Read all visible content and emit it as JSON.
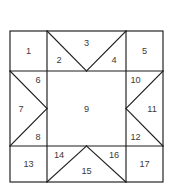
{
  "diagram": {
    "type": "geometric-partition",
    "shape": "3x3 grid with triangular subdivisions",
    "background_color": "#ffffff",
    "line_color": "#1d1d1d",
    "label_color": "#3a3a3a",
    "geometry": {
      "left": 10,
      "top": 31,
      "right": 163,
      "bottom": 182,
      "v_divider_1": 47,
      "v_divider_2": 126,
      "h_divider_1": 71,
      "h_divider_2": 146
    },
    "regions": [
      {
        "id": "region-1",
        "label": "1",
        "cell": "top-left",
        "shape": "square",
        "lx": 28.5,
        "ly": 51
      },
      {
        "id": "region-2",
        "label": "2",
        "cell": "top-middle",
        "shape": "triangle",
        "lx": 59,
        "ly": 60
      },
      {
        "id": "region-3",
        "label": "3",
        "cell": "top-middle",
        "shape": "triangle",
        "lx": 86.5,
        "ly": 43
      },
      {
        "id": "region-4",
        "label": "4",
        "cell": "top-middle",
        "shape": "triangle",
        "lx": 114,
        "ly": 60
      },
      {
        "id": "region-5",
        "label": "5",
        "cell": "top-right",
        "shape": "square",
        "lx": 144.5,
        "ly": 51
      },
      {
        "id": "region-6",
        "label": "6",
        "cell": "middle-left",
        "shape": "triangle",
        "lx": 38,
        "ly": 80
      },
      {
        "id": "region-7",
        "label": "7",
        "cell": "middle-left",
        "shape": "triangle",
        "lx": 21,
        "ly": 108.5
      },
      {
        "id": "region-8",
        "label": "8",
        "cell": "middle-left",
        "shape": "triangle",
        "lx": 38,
        "ly": 137
      },
      {
        "id": "region-9",
        "label": "9",
        "cell": "center",
        "shape": "square",
        "lx": 86.5,
        "ly": 108.5
      },
      {
        "id": "region-10",
        "label": "10",
        "cell": "middle-right",
        "shape": "triangle",
        "lx": 135.5,
        "ly": 80
      },
      {
        "id": "region-11",
        "label": "11",
        "cell": "middle-right",
        "shape": "triangle",
        "lx": 152,
        "ly": 108.5
      },
      {
        "id": "region-12",
        "label": "12",
        "cell": "middle-right",
        "shape": "triangle",
        "lx": 135.5,
        "ly": 137
      },
      {
        "id": "region-13",
        "label": "13",
        "cell": "bottom-left",
        "shape": "square",
        "lx": 28.5,
        "ly": 164
      },
      {
        "id": "region-14",
        "label": "14",
        "cell": "bottom-middle",
        "shape": "triangle",
        "lx": 59,
        "ly": 155
      },
      {
        "id": "region-15",
        "label": "15",
        "cell": "bottom-middle",
        "shape": "triangle",
        "lx": 86.5,
        "ly": 171
      },
      {
        "id": "region-16",
        "label": "16",
        "cell": "bottom-middle",
        "shape": "triangle",
        "lx": 114,
        "ly": 155
      },
      {
        "id": "region-17",
        "label": "17",
        "cell": "bottom-right",
        "shape": "square",
        "lx": 144.5,
        "ly": 164
      }
    ],
    "grid_lines": [
      {
        "name": "outer-border",
        "x1": 10,
        "y1": 31,
        "x2": 163,
        "y2": 182
      },
      {
        "name": "vertical-left",
        "x1": 47,
        "y1": 31,
        "x2": 47,
        "y2": 182
      },
      {
        "name": "vertical-right",
        "x1": 126,
        "y1": 31,
        "x2": 126,
        "y2": 182
      },
      {
        "name": "horizontal-top",
        "x1": 10,
        "y1": 71,
        "x2": 163,
        "y2": 71
      },
      {
        "name": "horizontal-bottom",
        "x1": 10,
        "y1": 146,
        "x2": 163,
        "y2": 146
      }
    ],
    "diagonals": [
      {
        "name": "top-middle-left-diagonal",
        "x1": 47,
        "y1": 31,
        "x2": 86.5,
        "y2": 71
      },
      {
        "name": "top-middle-right-diagonal",
        "x1": 126,
        "y1": 31,
        "x2": 86.5,
        "y2": 71
      },
      {
        "name": "middle-left-upper-diagonal",
        "x1": 10,
        "y1": 71,
        "x2": 47,
        "y2": 108.5
      },
      {
        "name": "middle-left-lower-diagonal",
        "x1": 10,
        "y1": 146,
        "x2": 47,
        "y2": 108.5
      },
      {
        "name": "middle-right-upper-diagonal",
        "x1": 163,
        "y1": 71,
        "x2": 126,
        "y2": 108.5
      },
      {
        "name": "middle-right-lower-diagonal",
        "x1": 163,
        "y1": 146,
        "x2": 126,
        "y2": 108.5
      },
      {
        "name": "bottom-middle-left-diagonal",
        "x1": 47,
        "y1": 182,
        "x2": 86.5,
        "y2": 146
      },
      {
        "name": "bottom-middle-right-diagonal",
        "x1": 126,
        "y1": 182,
        "x2": 86.5,
        "y2": 146
      }
    ]
  }
}
